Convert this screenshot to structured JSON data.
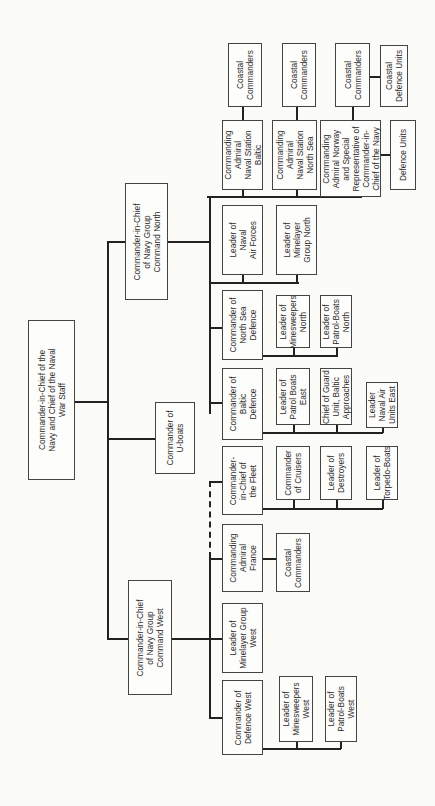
{
  "nodes": {
    "root": "Commander-in-Chief of the\nNavy and Chief of the Naval\nWar Staff",
    "north": "Commander-in-Chief\nof Navy Group\nCommand North",
    "uboats": "Commander of\nU-boats",
    "west": "Commander-in-Chief\nof Navy Group\nCommand West",
    "coastal_baltic": "Coastal\nCommanders",
    "coastal_northsea": "Coastal\nCommanders",
    "coastal_norway": "Coastal\nCommanders",
    "coastal_defence_units": "Coastal\nDefence Units",
    "station_baltic": "Commanding\nAdmiral\nNaval Station\nBaltic",
    "station_northsea": "Commanding\nAdmiral\nNaval Station\nNorth Sea",
    "admiral_norway": "Commanding\nAdmiral Norway\nand Special\nRepresentative of\nCommander-in-\nChief of the Navy",
    "defence_units": "Defence Units",
    "naval_air": "Leader of\nNaval\nAir Forces",
    "minelayer_north": "Leader of\nMinelayer\nGroup North",
    "northsea_defence": "Commander of\nNorth Sea\nDefence",
    "minesweepers_north": "Leader of\nMinesweepers\nNorth",
    "patrol_north": "Leader of\nPatrol-Boats\nNorth",
    "baltic_defence": "Commander of\nBaltic\nDefence",
    "patrol_east": "Leader of\nPatrol Boats\nEast",
    "guard_baltic": "Chief of Guard\nUnit, Baltic\nApproaches",
    "naval_air_east": "Leader\nNaval Air\nUnits East",
    "fleet": "Commander-\nin-Chief of\nthe Fleet",
    "cruisers": "Commander\nof Cruisers",
    "destroyers": "Leader of\nDestroyers",
    "torpedo": "Leader of\nTorpedo-Boats",
    "admiral_france": "Commanding\nAdmiral\nFrance",
    "coastal_france": "Coastal\nCommanders",
    "minelayer_west": "Leader of\nMinelayer Group\nWest",
    "defence_west": "Commander of\nDefence West",
    "minesweepers_west": "Leader of\nMinesweepers\nWest",
    "patrol_west": "Leader of\nPatrol-Boats\nWest"
  }
}
